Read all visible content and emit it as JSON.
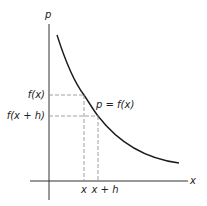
{
  "diagram": {
    "axes": {
      "y_label": "p",
      "x_label": "x"
    },
    "curve_label": "p = f(x)",
    "y_ticks": [
      {
        "label": "f(x)"
      },
      {
        "label": "f(x + h)"
      }
    ],
    "x_ticks": [
      {
        "label": "x"
      },
      {
        "label": "x + h"
      }
    ],
    "colors": {
      "axis": "#333333",
      "curve": "#1a1a1a",
      "dashed": "#888888"
    }
  }
}
